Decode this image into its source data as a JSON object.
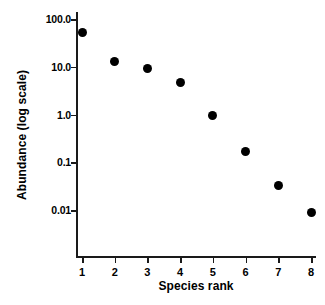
{
  "chart_data": {
    "type": "scatter",
    "title": "",
    "subtitle": "",
    "xlabel": "Species rank",
    "ylabel": "Abundance (log scale)",
    "x": [
      1,
      2,
      3,
      4,
      5,
      6,
      7,
      8
    ],
    "values": [
      52,
      13,
      9,
      4.7,
      0.95,
      0.17,
      0.033,
      0.0088
    ],
    "categories": [
      "1",
      "2",
      "3",
      "4",
      "5",
      "6",
      "7",
      "8"
    ],
    "series": [
      {
        "name": "Abundance",
        "values": [
          52,
          13,
          9,
          4.7,
          0.95,
          0.17,
          0.033,
          0.0088
        ]
      }
    ],
    "xlim": [
      0.6,
      8.4
    ],
    "ylim": [
      0.005,
      180
    ],
    "yscale": "log",
    "xscale": "linear",
    "x_tick_labels": [
      "1",
      "2",
      "3",
      "4",
      "5",
      "6",
      "7",
      "8"
    ],
    "x_tick_values": [
      1,
      2,
      3,
      4,
      5,
      6,
      7,
      8
    ],
    "y_tick_labels": [
      "100.0",
      "10.0",
      "1.0",
      "0.1",
      "0.01"
    ],
    "y_tick_values": [
      100,
      10,
      1,
      0.1,
      0.01
    ],
    "grid": false,
    "legend": null,
    "legend_position": "none",
    "annotations": [],
    "marker_color": "#000000",
    "marker_shape": "circle",
    "axis_color": "#1a1a1a",
    "background_color": "#ffffff"
  }
}
